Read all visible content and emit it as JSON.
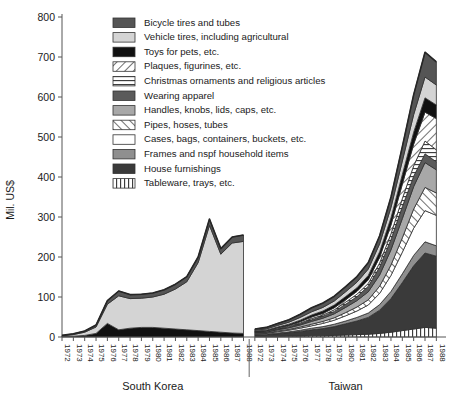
{
  "chart_data": {
    "type": "area",
    "subtype": "stacked-area, two panels",
    "title": "",
    "xlabel": "",
    "ylabel": "Mil. US$",
    "ylim": [
      0,
      800
    ],
    "yticks": [
      0,
      100,
      200,
      300,
      400,
      500,
      600,
      700,
      800
    ],
    "grid": false,
    "legend_position": "top-center-inside",
    "panels": [
      {
        "name": "South Korea",
        "x": [
          1972,
          1973,
          1974,
          1975,
          1976,
          1977,
          1978,
          1979,
          1980,
          1981,
          1982,
          1983,
          1984,
          1985,
          1986,
          1987,
          1988
        ]
      },
      {
        "name": "Taiwan",
        "x": [
          1972,
          1973,
          1974,
          1975,
          1976,
          1977,
          1978,
          1979,
          1980,
          1981,
          1982,
          1983,
          1984,
          1985,
          1986,
          1987,
          1988
        ]
      }
    ],
    "xticklabels": [
      "1972",
      "1973",
      "1974",
      "1975",
      "1976",
      "1977",
      "1978",
      "1979",
      "1980",
      "1981",
      "1982",
      "1983",
      "1984",
      "1985",
      "1986",
      "1987",
      "1988"
    ],
    "series": [
      {
        "name": "Bicycle tires and tubes",
        "pattern": "solid-dark-gray",
        "color": "#555555",
        "south_korea": [
          1,
          2,
          3,
          5,
          9,
          12,
          10,
          10,
          10,
          11,
          12,
          13,
          14,
          16,
          14,
          15,
          16
        ],
        "taiwan": [
          3,
          4,
          5,
          6,
          8,
          10,
          11,
          12,
          13,
          14,
          16,
          20,
          26,
          36,
          50,
          62,
          58
        ]
      },
      {
        "name": "Vehicle tires, including agricultural",
        "pattern": "solid-light-gray",
        "color": "#d4d4d4",
        "south_korea": [
          2,
          4,
          8,
          16,
          48,
          85,
          74,
          73,
          76,
          85,
          100,
          120,
          170,
          265,
          195,
          225,
          230
        ],
        "taiwan": [
          2,
          3,
          4,
          5,
          7,
          8,
          9,
          10,
          12,
          14,
          16,
          20,
          26,
          34,
          44,
          52,
          50
        ]
      },
      {
        "name": "Toys for pets, etc.",
        "pattern": "solid-black",
        "color": "#111111",
        "south_korea": [
          1,
          2,
          4,
          9,
          34,
          18,
          22,
          24,
          24,
          22,
          20,
          18,
          16,
          14,
          12,
          10,
          9
        ],
        "taiwan": [
          1,
          2,
          2,
          3,
          4,
          5,
          6,
          7,
          8,
          9,
          11,
          14,
          18,
          24,
          30,
          36,
          34
        ]
      },
      {
        "name": "Plaques, figurines, etc.",
        "pattern": "hatch-forward",
        "color": "#ffffff",
        "south_korea": [
          0,
          0,
          0,
          0,
          0,
          0,
          0,
          0,
          0,
          0,
          0,
          0,
          0,
          0,
          0,
          0,
          0
        ],
        "taiwan": [
          1,
          1,
          2,
          2,
          3,
          4,
          4,
          5,
          6,
          7,
          9,
          14,
          22,
          36,
          54,
          72,
          78
        ]
      },
      {
        "name": "Christmas ornaments and religious articles",
        "pattern": "horizontal-lines",
        "color": "#ffffff",
        "south_korea": [
          0,
          0,
          0,
          0,
          0,
          0,
          0,
          0,
          0,
          0,
          0,
          0,
          0,
          0,
          0,
          0,
          0
        ],
        "taiwan": [
          1,
          1,
          1,
          2,
          2,
          3,
          3,
          4,
          5,
          6,
          7,
          10,
          14,
          20,
          26,
          32,
          30
        ]
      },
      {
        "name": "Wearing apparel",
        "pattern": "solid-dark-gray",
        "color": "#5a5a5a",
        "south_korea": [
          0,
          0,
          0,
          0,
          0,
          0,
          0,
          0,
          0,
          0,
          0,
          0,
          0,
          0,
          0,
          0,
          0
        ],
        "taiwan": [
          1,
          1,
          2,
          2,
          3,
          4,
          5,
          6,
          8,
          10,
          14,
          20,
          26,
          30,
          26,
          22,
          20
        ]
      },
      {
        "name": "Handles, knobs, lids, caps, etc.",
        "pattern": "solid-mid-gray",
        "color": "#a8a8a8",
        "south_korea": [
          0,
          0,
          0,
          0,
          0,
          0,
          0,
          0,
          0,
          0,
          0,
          0,
          0,
          0,
          0,
          0,
          0
        ],
        "taiwan": [
          2,
          2,
          3,
          4,
          5,
          7,
          8,
          10,
          13,
          16,
          20,
          28,
          38,
          48,
          56,
          62,
          58
        ]
      },
      {
        "name": "Pipes, hoses, tubes",
        "pattern": "hatch-back",
        "color": "#ffffff",
        "south_korea": [
          0,
          0,
          0,
          0,
          0,
          0,
          0,
          0,
          0,
          0,
          0,
          0,
          0,
          0,
          0,
          0,
          0
        ],
        "taiwan": [
          1,
          1,
          2,
          2,
          3,
          4,
          5,
          6,
          8,
          10,
          13,
          18,
          26,
          36,
          48,
          58,
          56
        ]
      },
      {
        "name": "Cases, bags, containers, buckets, etc.",
        "pattern": "white",
        "color": "#ffffff",
        "south_korea": [
          0,
          0,
          0,
          0,
          0,
          0,
          0,
          0,
          0,
          0,
          0,
          0,
          0,
          0,
          0,
          0,
          0
        ],
        "taiwan": [
          2,
          2,
          3,
          4,
          5,
          6,
          8,
          10,
          13,
          16,
          20,
          28,
          40,
          54,
          68,
          78,
          76
        ]
      },
      {
        "name": "Frames and nspf household items",
        "pattern": "solid-mid-gray",
        "color": "#8f8f8f",
        "south_korea": [
          0,
          0,
          0,
          0,
          0,
          0,
          0,
          0,
          0,
          0,
          0,
          0,
          0,
          0,
          0,
          0,
          0
        ],
        "taiwan": [
          1,
          1,
          2,
          2,
          3,
          4,
          5,
          6,
          7,
          9,
          11,
          14,
          18,
          22,
          26,
          28,
          26
        ]
      },
      {
        "name": "House furnishings",
        "pattern": "solid-dark",
        "color": "#3a3a3a",
        "south_korea": [
          0,
          0,
          0,
          0,
          0,
          0,
          0,
          0,
          0,
          0,
          0,
          0,
          0,
          0,
          0,
          0,
          0
        ],
        "taiwan": [
          4,
          5,
          7,
          9,
          12,
          15,
          18,
          22,
          28,
          34,
          42,
          58,
          84,
          120,
          158,
          186,
          180
        ]
      },
      {
        "name": "Tableware, trays, etc.",
        "pattern": "vertical-lines",
        "color": "#ffffff",
        "south_korea": [
          0,
          0,
          0,
          0,
          0,
          0,
          0,
          0,
          0,
          0,
          0,
          0,
          0,
          0,
          0,
          0,
          0
        ],
        "taiwan": [
          1,
          1,
          1,
          2,
          2,
          3,
          3,
          4,
          5,
          6,
          7,
          9,
          12,
          16,
          20,
          24,
          22
        ]
      }
    ],
    "totals": {
      "south_korea": [
        4,
        8,
        15,
        30,
        91,
        115,
        106,
        107,
        110,
        118,
        132,
        151,
        200,
        295,
        221,
        250,
        255
      ],
      "taiwan": [
        20,
        24,
        34,
        43,
        57,
        73,
        85,
        102,
        126,
        151,
        186,
        253,
        350,
        476,
        606,
        672,
        648
      ]
    },
    "notes": {
      "south_korea_peak_year": "1985",
      "south_korea_peak_value": 295,
      "taiwan_peak_year": "1987",
      "taiwan_peak_value": 672
    }
  },
  "axis": {
    "ylabel": "Mil. US$",
    "yticks": [
      "0",
      "100",
      "200",
      "300",
      "400",
      "500",
      "600",
      "700",
      "800"
    ]
  },
  "groups": [
    {
      "label": "South Korea"
    },
    {
      "label": "Taiwan"
    }
  ],
  "legend": {
    "items": [
      {
        "label": "Bicycle tires and tubes",
        "swatch": "solid-dark-gray-swatch"
      },
      {
        "label": "Vehicle tires, including agricultural",
        "swatch": "solid-light-gray-swatch"
      },
      {
        "label": "Toys for pets, etc.",
        "swatch": "solid-black-swatch"
      },
      {
        "label": "Plaques, figurines, etc.",
        "swatch": "hatch-forward-swatch"
      },
      {
        "label": "Christmas ornaments and religious articles",
        "swatch": "horizontal-lines-swatch"
      },
      {
        "label": "Wearing apparel",
        "swatch": "solid-dark-gray-swatch"
      },
      {
        "label": "Handles, knobs, lids, caps, etc.",
        "swatch": "solid-mid-gray-swatch"
      },
      {
        "label": "Pipes, hoses, tubes",
        "swatch": "hatch-back-swatch"
      },
      {
        "label": "Cases, bags, containers, buckets, etc.",
        "swatch": "white-swatch"
      },
      {
        "label": "Frames and nspf household items",
        "swatch": "solid-mid-gray-swatch"
      },
      {
        "label": "House furnishings",
        "swatch": "solid-dark-swatch"
      },
      {
        "label": "Tableware, trays, etc.",
        "swatch": "vertical-lines-swatch"
      }
    ]
  }
}
